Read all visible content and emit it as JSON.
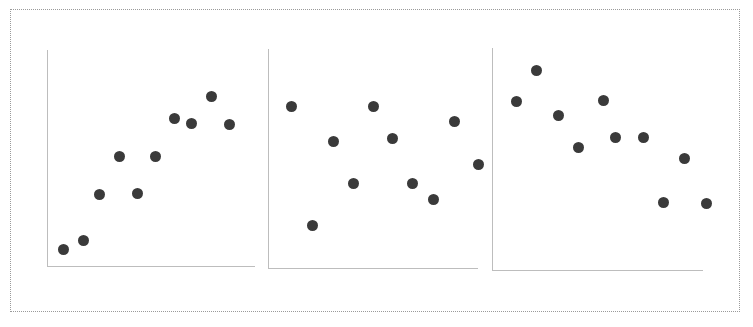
{
  "figure": {
    "background_color": "#ffffff",
    "border_color": "#9a9a9a",
    "border_style": "dotted",
    "axis_color": "#bdbdbd",
    "marker_color": "#3a3a3a",
    "marker_size_px": 11
  },
  "chart_data": [
    {
      "type": "scatter",
      "title": "",
      "subtitle": "",
      "xlabel": "",
      "ylabel": "",
      "xlim": [
        0,
        100
      ],
      "ylim": [
        0,
        100
      ],
      "grid": false,
      "legend": null,
      "annotations": [],
      "ticklabels": {
        "x": [],
        "y": []
      },
      "description": "Left panel: strong positive association",
      "series": [
        {
          "name": "panel-1",
          "x": [
            8,
            18,
            26,
            35,
            44,
            52,
            62,
            70,
            79,
            88
          ],
          "y": [
            8,
            12,
            34,
            52,
            35,
            52,
            70,
            68,
            80,
            68
          ],
          "points_px": [
            [
              63,
              249
            ],
            [
              83,
              240
            ],
            [
              99,
              194
            ],
            [
              119,
              156
            ],
            [
              137,
              193
            ],
            [
              155,
              156
            ],
            [
              174,
              118
            ],
            [
              191,
              123
            ],
            [
              211,
              96
            ],
            [
              229,
              124
            ]
          ]
        }
      ]
    },
    {
      "type": "scatter",
      "title": "",
      "subtitle": "",
      "xlabel": "",
      "ylabel": "",
      "xlim": [
        0,
        100
      ],
      "ylim": [
        0,
        100
      ],
      "grid": false,
      "legend": null,
      "annotations": [],
      "ticklabels": {
        "x": [],
        "y": []
      },
      "description": "Middle panel: no association (random scatter)",
      "series": [
        {
          "name": "panel-2",
          "x": [
            11,
            21,
            31,
            41,
            50,
            59,
            69,
            78,
            88,
            97
          ],
          "y": [
            76,
            56,
            20,
            40,
            76,
            58,
            40,
            32,
            68,
            48
          ],
          "points_px": [
            [
              291,
              106
            ],
            [
              333,
              141
            ],
            [
              312,
              225
            ],
            [
              353,
              183
            ],
            [
              373,
              106
            ],
            [
              392,
              138
            ],
            [
              412,
              183
            ],
            [
              433,
              199
            ],
            [
              454,
              121
            ],
            [
              478,
              164
            ]
          ]
        }
      ]
    },
    {
      "type": "scatter",
      "title": "",
      "subtitle": "",
      "xlabel": "",
      "ylabel": "",
      "xlim": [
        0,
        100
      ],
      "ylim": [
        0,
        100
      ],
      "grid": false,
      "legend": null,
      "annotations": [],
      "ticklabels": {
        "x": [],
        "y": []
      },
      "description": "Right panel: negative association",
      "series": [
        {
          "name": "panel-3",
          "x": [
            11,
            21,
            31,
            41,
            52,
            60,
            70,
            79,
            89,
            99
          ],
          "y": [
            81,
            94,
            74,
            60,
            81,
            66,
            66,
            38,
            56,
            38
          ],
          "points_px": [
            [
              516,
              101
            ],
            [
              536,
              70
            ],
            [
              558,
              115
            ],
            [
              578,
              147
            ],
            [
              603,
              100
            ],
            [
              615,
              137
            ],
            [
              643,
              137
            ],
            [
              663,
              202
            ],
            [
              684,
              158
            ],
            [
              706,
              203
            ]
          ]
        }
      ]
    }
  ],
  "panels": [
    {
      "name": "panel-1",
      "axis_y": {
        "x": 47,
        "top": 50,
        "height": 216
      },
      "axis_x": {
        "left": 47,
        "y": 266,
        "width": 208
      }
    },
    {
      "name": "panel-2",
      "axis_y": {
        "x": 268,
        "top": 49,
        "height": 219
      },
      "axis_x": {
        "left": 268,
        "y": 268,
        "width": 210
      }
    },
    {
      "name": "panel-3",
      "axis_y": {
        "x": 492,
        "top": 48,
        "height": 222
      },
      "axis_x": {
        "left": 492,
        "y": 270,
        "width": 211
      }
    }
  ]
}
